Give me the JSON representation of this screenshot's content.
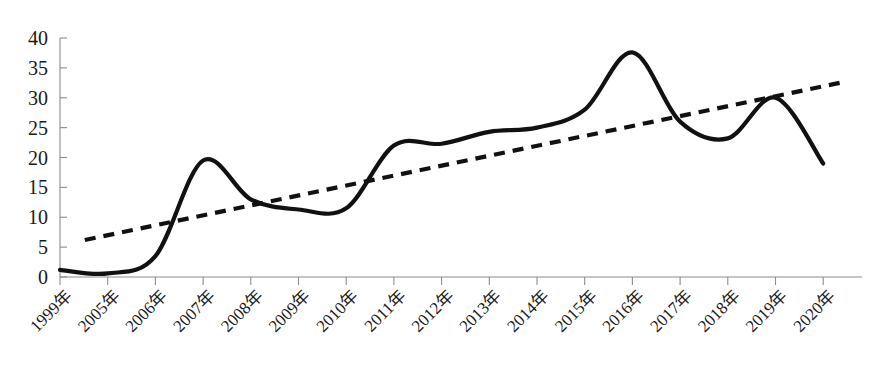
{
  "chart_data": {
    "type": "line",
    "title": "",
    "subtitle": "",
    "xlabel": "",
    "ylabel": "",
    "categories": [
      "1999年",
      "2005年",
      "2006年",
      "2007年",
      "2008年",
      "2009年",
      "2010年",
      "2011年",
      "2012年",
      "2013年",
      "2014年",
      "2015年",
      "2016年",
      "2017年",
      "2018年",
      "2019年",
      "2020年"
    ],
    "series": [
      {
        "name": "数量",
        "style": "solid-smooth",
        "values": [
          1.2,
          0.6,
          3.5,
          19.5,
          13.0,
          11.3,
          11.5,
          22.0,
          22.3,
          24.3,
          25.0,
          28.0,
          37.6,
          26.0,
          23.2,
          30.0,
          19.0
        ]
      },
      {
        "name": "趋势线",
        "style": "dashed-linear",
        "values": [
          6.2,
          8.0,
          9.6,
          11.3,
          12.9,
          14.6,
          16.2,
          17.9,
          19.5,
          21.2,
          22.8,
          24.5,
          26.1,
          27.8,
          29.4,
          31.1,
          32.5
        ]
      }
    ],
    "ylim": [
      0,
      40
    ],
    "yticks": [
      0,
      5,
      10,
      15,
      20,
      25,
      30,
      35,
      40
    ],
    "ytick_labels": [
      "0",
      "5",
      "10",
      "15",
      "20",
      "25",
      "30",
      "35",
      "40"
    ],
    "grid": false,
    "legend": false,
    "legend_position": "none",
    "xtick_rotation": 45,
    "colors": {
      "series_line": "#111111",
      "trend_line": "#111111",
      "axis": "#8c8c8c",
      "text": "#1a1a1a",
      "background": "#ffffff"
    }
  }
}
